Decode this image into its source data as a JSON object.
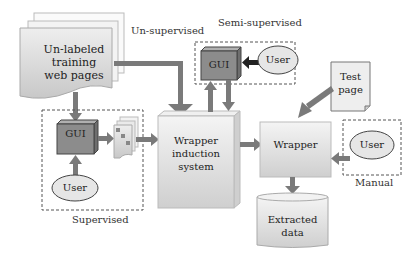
{
  "diagram": {
    "unlabeled_pages": "Un-labeled\ntraining\nweb pages",
    "unlabeled_l1": "Un-labeled",
    "unlabeled_l2": "training",
    "unlabeled_l3": "web pages",
    "unsupervised_label": "Un-supervised",
    "semi_supervised_label": "Semi-supervised",
    "supervised_label": "Supervised",
    "manual_label": "Manual",
    "gui_label": "GUI",
    "user_label": "User",
    "test_page_l1": "Test",
    "test_page_l2": "page",
    "wis_l1": "Wrapper",
    "wis_l2": "induction",
    "wis_l3": "system",
    "wrapper_label": "Wrapper",
    "extracted_l1": "Extracted",
    "extracted_l2": "data"
  },
  "colors": {
    "arrow": "#7a7a7a",
    "gui_fill": "#8c8c8c",
    "box_fill": "#e4e4e4",
    "page_fill": "#d9d9d9",
    "user_fill": "#e6e6e6",
    "border": "#555555"
  }
}
